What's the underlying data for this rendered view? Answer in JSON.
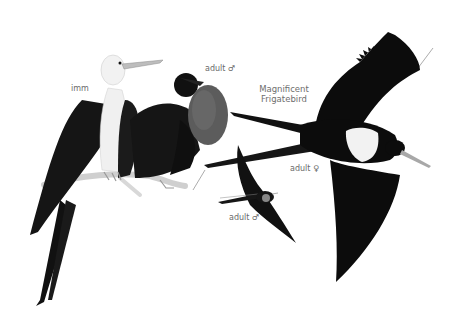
{
  "plate": {
    "title_line1": "Magnificent",
    "title_line2": "Frigatebird",
    "labels": {
      "immature": "imm",
      "adult_male_perched": "adult ♂",
      "adult_female_flying": "adult ♀",
      "adult_male_flying": "adult ♂"
    },
    "colors": {
      "background": "#ffffff",
      "plumage": "#0d0d0d",
      "white_patch": "#f2f2f2",
      "gular_pouch": "#5a5a5a",
      "label_text": "#6a6a6a"
    }
  }
}
